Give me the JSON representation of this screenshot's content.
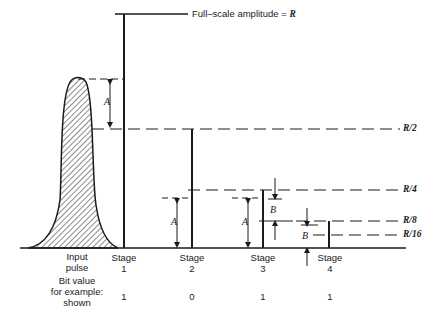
{
  "full_scale": {
    "text": "Full–scale amplitude = ",
    "symbol": "R"
  },
  "levels": [
    {
      "label": "R/2"
    },
    {
      "label": "R/4"
    },
    {
      "label": "R/8"
    },
    {
      "label": "R/16"
    }
  ],
  "dimension_labels": {
    "a": "A",
    "b": "B"
  },
  "input": {
    "line1": "Input",
    "line2": "pulse"
  },
  "stages": [
    {
      "line1": "Stage",
      "num": "1",
      "bit": "1"
    },
    {
      "line1": "Stage",
      "num": "2",
      "bit": "0"
    },
    {
      "line1": "Stage",
      "num": "3",
      "bit": "1"
    },
    {
      "line1": "Stage",
      "num": "4",
      "bit": "1"
    }
  ],
  "bit_row": {
    "line1": "Bit value",
    "line2": "for example:",
    "line3": "shown"
  },
  "colors": {
    "ink": "#1a1a1a",
    "background": "#ffffff"
  }
}
